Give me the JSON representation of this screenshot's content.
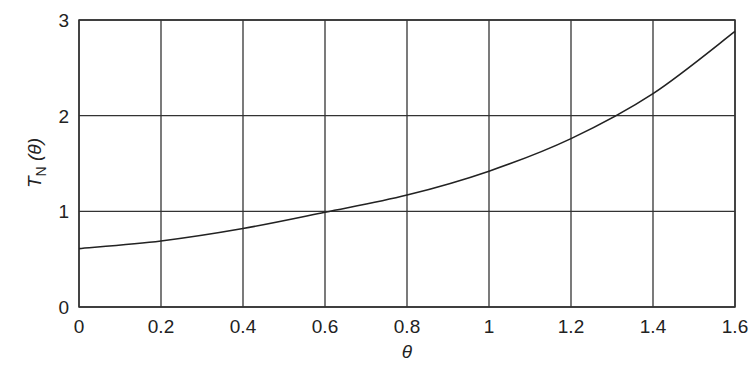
{
  "chart_data": {
    "type": "line",
    "title": "",
    "xlabel": "θ",
    "ylabel": "T_N (θ)",
    "ylabel_main": "T",
    "ylabel_sub": "N",
    "ylabel_arg": " (θ)",
    "xlim": [
      0,
      1.6
    ],
    "ylim": [
      0,
      3
    ],
    "grid": true,
    "legend": null,
    "x_ticks": [
      "0",
      "0.2",
      "0.4",
      "0.6",
      "0.8",
      "1",
      "1.2",
      "1.4",
      "1.6"
    ],
    "y_ticks": [
      "0",
      "1",
      "2",
      "3"
    ],
    "series": [
      {
        "name": "T_N(θ)",
        "x": [
          0,
          0.2,
          0.4,
          0.6,
          0.8,
          1.0,
          1.2,
          1.4,
          1.6
        ],
        "values": [
          0.61,
          0.69,
          0.82,
          0.99,
          1.17,
          1.42,
          1.76,
          2.23,
          2.88
        ]
      }
    ]
  }
}
